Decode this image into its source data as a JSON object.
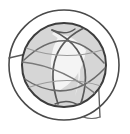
{
  "image": {
    "kind": "logo-emblem",
    "alt_text": "Circular globe emblem",
    "width": 130,
    "height": 134,
    "background_color": "#ffffff"
  },
  "emblem": {
    "name": "globe-orbit-emblem",
    "description": "Concentric dark rings enclosing a light gray disc crossed by curved meridian arcs forming a central white lens shape",
    "center_x": 64,
    "center_y": 65,
    "outer_ring": {
      "name": "outer-ring",
      "radius": 55,
      "stroke_color": "#4a4a4a",
      "stroke_width": 1.6,
      "fill": "none"
    },
    "inner_ring": {
      "name": "inner-ring",
      "radius": 43,
      "stroke_color": "#3d3d3d",
      "stroke_width": 2.0,
      "fill": "#d8d8d8"
    },
    "disc": {
      "name": "globe-disc",
      "radius": 42,
      "fill_color": "#d6d6d6"
    },
    "lens": {
      "name": "center-lens-highlight",
      "fill_color": "#f2f2f2"
    },
    "arc_stroke_color": "#5a5a5a",
    "arc_stroke_width": 1.5,
    "arc_light_color": "#8c8c8c",
    "arcs": [
      {
        "name": "meridian-arc-left"
      },
      {
        "name": "meridian-arc-right"
      },
      {
        "name": "equator-arc-upper"
      },
      {
        "name": "equator-arc-lower"
      },
      {
        "name": "diagonal-sweep-arc"
      },
      {
        "name": "tangent-line-left"
      },
      {
        "name": "tangent-line-lower-right"
      }
    ]
  }
}
